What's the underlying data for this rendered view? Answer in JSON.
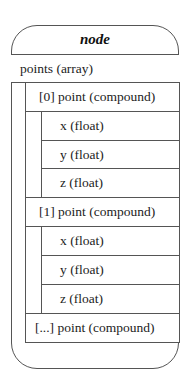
{
  "title": "node",
  "rows": {
    "points": "points (array)",
    "p0": "[0] point (compound)",
    "p0x": "x (float)",
    "p0y": "y (float)",
    "p0z": "z (float)",
    "p1": "[1] point (compound)",
    "p1x": "x (float)",
    "p1y": "y (float)",
    "p1z": "z (float)",
    "pn": "[...] point (compound)"
  }
}
